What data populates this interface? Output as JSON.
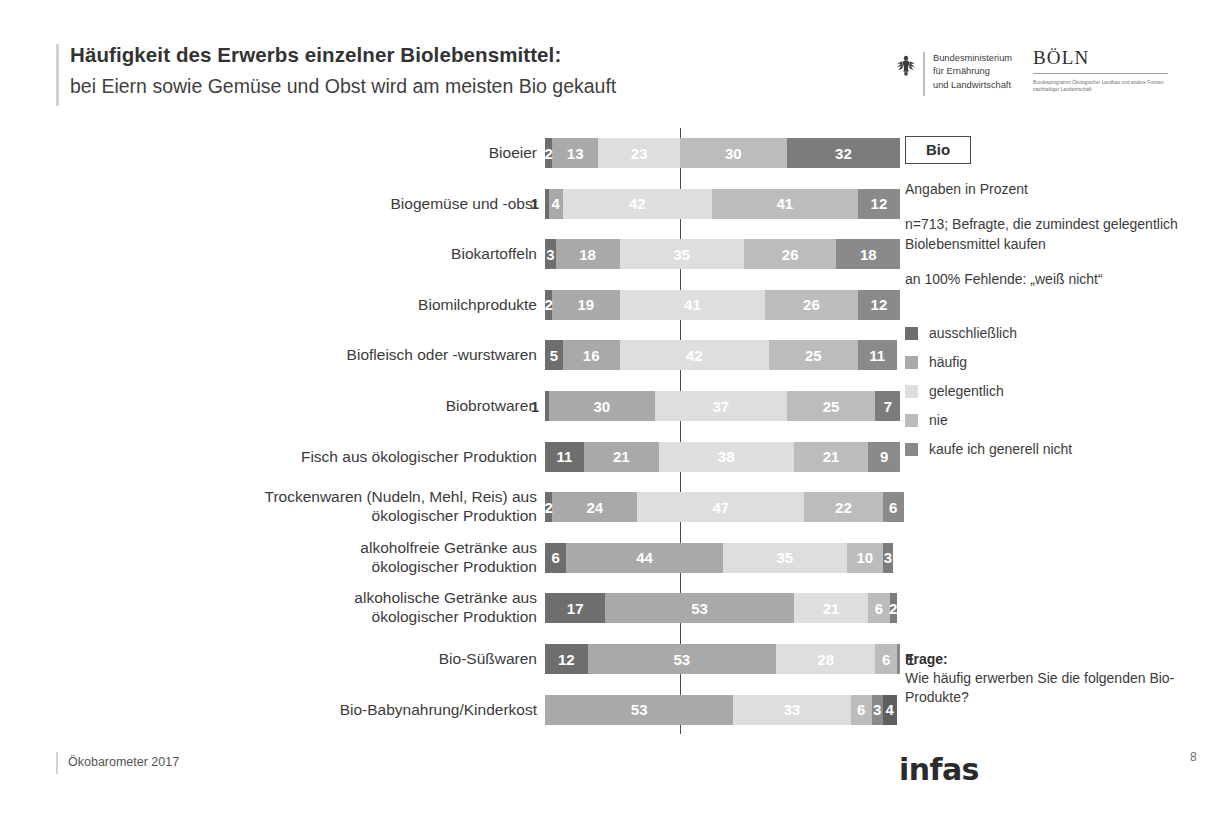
{
  "header": {
    "title_main": "Häufigkeit des Erwerbs einzelner Biolebensmittel:",
    "title_sub": "bei Eiern sowie Gemüse und Obst wird am meisten Bio gekauft",
    "bmel_line1": "Bundesministerium",
    "bmel_line2": "für Ernährung",
    "bmel_line3": "und Landwirtschaft",
    "boeln_word": "BÖLN",
    "boeln_tagline": "Bundesprogramm Ökologischer Landbau und andere Formen nachhaltiger Landwirtschaft"
  },
  "panel": {
    "bio_badge": "Bio",
    "units_note": "Angaben in Prozent",
    "base_note": "n=713; Befragte, die zumindest gelegentlich Biolebensmittel kaufen",
    "missing_note": "an 100% Fehlende: „weiß nicht“",
    "frage_label": "Frage:",
    "frage_text": "Wie häufig erwerben Sie die folgenden Bio-Produkte?"
  },
  "footer": {
    "source": "Ökobarometer 2017",
    "brand": "infas",
    "page_number": "8"
  },
  "chart_data": {
    "type": "bar",
    "orientation": "horizontal",
    "stacked": true,
    "title": "Häufigkeit des Erwerbs einzelner Biolebensmittel:",
    "subtitle": "bei Eiern sowie Gemüse und Obst wird am meisten Bio gekauft",
    "xlabel": "",
    "ylabel": "",
    "value_unit": "Prozent",
    "xlim": [
      0,
      100
    ],
    "grid": false,
    "legend_position": "right",
    "reference_line_at": 38,
    "series": [
      {
        "name": "ausschließlich",
        "color": "#6e6e6e",
        "values": [
          2,
          1,
          3,
          2,
          5,
          1,
          11,
          2,
          6,
          17,
          12,
          0
        ]
      },
      {
        "name": "häufig",
        "color": "#a9a9a9",
        "values": [
          13,
          4,
          18,
          19,
          16,
          30,
          21,
          24,
          44,
          53,
          53,
          53
        ]
      },
      {
        "name": "gelegentlich",
        "color": "#dedede",
        "values": [
          23,
          42,
          35,
          41,
          42,
          37,
          38,
          47,
          35,
          21,
          28,
          33
        ]
      },
      {
        "name": "nie",
        "color": "#bcbcbc",
        "values": [
          30,
          41,
          26,
          26,
          25,
          25,
          21,
          22,
          10,
          6,
          6,
          6
        ]
      },
      {
        "name": "kaufe ich generell nicht",
        "color": "#8a8a8a",
        "values": [
          32,
          12,
          18,
          12,
          11,
          7,
          9,
          6,
          3,
          2,
          1,
          3
        ]
      }
    ],
    "extra_segment": {
      "name": "rest",
      "color": "#5f5f5f",
      "values": [
        0,
        0,
        0,
        0,
        0,
        0,
        0,
        0,
        0,
        0,
        0,
        4
      ]
    },
    "categories": [
      "Bioeier",
      "Biogemüse und -obst",
      "Biokartoffeln",
      "Biomilchprodukte",
      "Biofleisch oder  -wurstwaren",
      "Biobrotwaren",
      "Fisch aus ökologischer Produktion",
      "Trockenwaren (Nudeln, Mehl, Reis) aus ökologischer Produktion",
      "alkoholfreie Getränke aus ökologischer Produktion",
      "alkoholische Getränke aus ökologischer Produktion",
      "Bio-Süßwaren",
      "Bio-Babynahrung/Kinderkost"
    ],
    "rows": [
      {
        "label": "Bioeier",
        "label_lines": [
          "Bioeier"
        ],
        "segments": [
          {
            "series": "ausschließlich",
            "value": 2,
            "color": "#6e6e6e",
            "label": "2",
            "placement": "inside"
          },
          {
            "series": "häufig",
            "value": 13,
            "color": "#a9a9a9",
            "label": "13",
            "placement": "inside"
          },
          {
            "series": "gelegentlich",
            "value": 23,
            "color": "#dedede",
            "label": "23",
            "placement": "inside"
          },
          {
            "series": "nie",
            "value": 30,
            "color": "#bcbcbc",
            "label": "30",
            "placement": "inside"
          },
          {
            "series": "kaufe ich generell nicht",
            "value": 32,
            "color": "#7c7c7c",
            "label": "32",
            "placement": "inside"
          }
        ]
      },
      {
        "label": "Biogemüse und -obst",
        "label_lines": [
          "Biogemüse und -obst"
        ],
        "segments": [
          {
            "series": "ausschließlich",
            "value": 1,
            "color": "#6e6e6e",
            "label": "1",
            "placement": "outside-left"
          },
          {
            "series": "häufig",
            "value": 4,
            "color": "#a9a9a9",
            "label": "4",
            "placement": "inside"
          },
          {
            "series": "gelegentlich",
            "value": 42,
            "color": "#dedede",
            "label": "42",
            "placement": "inside"
          },
          {
            "series": "nie",
            "value": 41,
            "color": "#bcbcbc",
            "label": "41",
            "placement": "inside"
          },
          {
            "series": "kaufe ich generell nicht",
            "value": 12,
            "color": "#8a8a8a",
            "label": "12",
            "placement": "inside"
          }
        ]
      },
      {
        "label": "Biokartoffeln",
        "label_lines": [
          "Biokartoffeln"
        ],
        "segments": [
          {
            "series": "ausschließlich",
            "value": 3,
            "color": "#6e6e6e",
            "label": "3",
            "placement": "inside"
          },
          {
            "series": "häufig",
            "value": 18,
            "color": "#a9a9a9",
            "label": "18",
            "placement": "inside"
          },
          {
            "series": "gelegentlich",
            "value": 35,
            "color": "#dedede",
            "label": "35",
            "placement": "inside"
          },
          {
            "series": "nie",
            "value": 26,
            "color": "#bcbcbc",
            "label": "26",
            "placement": "inside"
          },
          {
            "series": "kaufe ich generell nicht",
            "value": 18,
            "color": "#8a8a8a",
            "label": "18",
            "placement": "inside"
          }
        ]
      },
      {
        "label": "Biomilchprodukte",
        "label_lines": [
          "Biomilchprodukte"
        ],
        "segments": [
          {
            "series": "ausschließlich",
            "value": 2,
            "color": "#6e6e6e",
            "label": "2",
            "placement": "inside"
          },
          {
            "series": "häufig",
            "value": 19,
            "color": "#a9a9a9",
            "label": "19",
            "placement": "inside"
          },
          {
            "series": "gelegentlich",
            "value": 41,
            "color": "#dedede",
            "label": "41",
            "placement": "inside"
          },
          {
            "series": "nie",
            "value": 26,
            "color": "#bcbcbc",
            "label": "26",
            "placement": "inside"
          },
          {
            "series": "kaufe ich generell nicht",
            "value": 12,
            "color": "#8a8a8a",
            "label": "12",
            "placement": "inside"
          }
        ]
      },
      {
        "label": "Biofleisch oder  -wurstwaren",
        "label_lines": [
          "Biofleisch oder  -wurstwaren"
        ],
        "segments": [
          {
            "series": "ausschließlich",
            "value": 5,
            "color": "#6e6e6e",
            "label": "5",
            "placement": "inside"
          },
          {
            "series": "häufig",
            "value": 16,
            "color": "#a9a9a9",
            "label": "16",
            "placement": "inside"
          },
          {
            "series": "gelegentlich",
            "value": 42,
            "color": "#dedede",
            "label": "42",
            "placement": "inside"
          },
          {
            "series": "nie",
            "value": 25,
            "color": "#bcbcbc",
            "label": "25",
            "placement": "inside"
          },
          {
            "series": "kaufe ich generell nicht",
            "value": 11,
            "color": "#8a8a8a",
            "label": "11",
            "placement": "inside"
          }
        ]
      },
      {
        "label": "Biobrotwaren",
        "label_lines": [
          "Biobrotwaren"
        ],
        "segments": [
          {
            "series": "ausschließlich",
            "value": 1,
            "color": "#6e6e6e",
            "label": "1",
            "placement": "outside-left"
          },
          {
            "series": "häufig",
            "value": 30,
            "color": "#a9a9a9",
            "label": "30",
            "placement": "inside"
          },
          {
            "series": "gelegentlich",
            "value": 37,
            "color": "#dedede",
            "label": "37",
            "placement": "inside"
          },
          {
            "series": "nie",
            "value": 25,
            "color": "#bcbcbc",
            "label": "25",
            "placement": "inside"
          },
          {
            "series": "kaufe ich generell nicht",
            "value": 7,
            "color": "#7c7c7c",
            "label": "7",
            "placement": "inside"
          }
        ]
      },
      {
        "label": "Fisch aus ökologischer Produktion",
        "label_lines": [
          "Fisch aus ökologischer Produktion"
        ],
        "segments": [
          {
            "series": "ausschließlich",
            "value": 11,
            "color": "#6e6e6e",
            "label": "11",
            "placement": "inside"
          },
          {
            "series": "häufig",
            "value": 21,
            "color": "#a9a9a9",
            "label": "21",
            "placement": "inside"
          },
          {
            "series": "gelegentlich",
            "value": 38,
            "color": "#dedede",
            "label": "38",
            "placement": "inside"
          },
          {
            "series": "nie",
            "value": 21,
            "color": "#bcbcbc",
            "label": "21",
            "placement": "inside"
          },
          {
            "series": "kaufe ich generell nicht",
            "value": 9,
            "color": "#8a8a8a",
            "label": "9",
            "placement": "inside"
          }
        ]
      },
      {
        "label": "Trockenwaren (Nudeln, Mehl, Reis) aus ökologischer Produktion",
        "label_lines": [
          "Trockenwaren (Nudeln, Mehl, Reis) aus",
          "ökologischer Produktion"
        ],
        "segments": [
          {
            "series": "ausschließlich",
            "value": 2,
            "color": "#6e6e6e",
            "label": "2",
            "placement": "inside"
          },
          {
            "series": "häufig",
            "value": 24,
            "color": "#a9a9a9",
            "label": "24",
            "placement": "inside"
          },
          {
            "series": "gelegentlich",
            "value": 47,
            "color": "#dedede",
            "label": "47",
            "placement": "inside"
          },
          {
            "series": "nie",
            "value": 22,
            "color": "#bcbcbc",
            "label": "22",
            "placement": "inside"
          },
          {
            "series": "kaufe ich generell nicht",
            "value": 6,
            "color": "#8a8a8a",
            "label": "6",
            "placement": "inside"
          }
        ]
      },
      {
        "label": "alkoholfreie Getränke aus ökologischer Produktion",
        "label_lines": [
          "alkoholfreie Getränke aus",
          "ökologischer Produktion"
        ],
        "segments": [
          {
            "series": "ausschließlich",
            "value": 6,
            "color": "#6e6e6e",
            "label": "6",
            "placement": "inside"
          },
          {
            "series": "häufig",
            "value": 44,
            "color": "#a9a9a9",
            "label": "44",
            "placement": "inside"
          },
          {
            "series": "gelegentlich",
            "value": 35,
            "color": "#dedede",
            "label": "35",
            "placement": "inside"
          },
          {
            "series": "nie",
            "value": 10,
            "color": "#bcbcbc",
            "label": "10",
            "placement": "inside"
          },
          {
            "series": "kaufe ich generell nicht",
            "value": 3,
            "color": "#7c7c7c",
            "label": "3",
            "placement": "inside"
          }
        ]
      },
      {
        "label": "alkoholische Getränke aus ökologischer Produktion",
        "label_lines": [
          "alkoholische Getränke aus",
          "ökologischer Produktion"
        ],
        "segments": [
          {
            "series": "ausschließlich",
            "value": 17,
            "color": "#6e6e6e",
            "label": "17",
            "placement": "inside"
          },
          {
            "series": "häufig",
            "value": 53,
            "color": "#a9a9a9",
            "label": "53",
            "placement": "inside"
          },
          {
            "series": "gelegentlich",
            "value": 21,
            "color": "#dedede",
            "label": "21",
            "placement": "inside"
          },
          {
            "series": "nie",
            "value": 6,
            "color": "#bcbcbc",
            "label": "6",
            "placement": "inside"
          },
          {
            "series": "kaufe ich generell nicht",
            "value": 2,
            "color": "#7c7c7c",
            "label": "2",
            "placement": "inside"
          }
        ]
      },
      {
        "label": "Bio-Süßwaren",
        "label_lines": [
          "Bio-Süßwaren"
        ],
        "segments": [
          {
            "series": "ausschließlich",
            "value": 12,
            "color": "#6e6e6e",
            "label": "12",
            "placement": "inside"
          },
          {
            "series": "häufig",
            "value": 53,
            "color": "#a9a9a9",
            "label": "53",
            "placement": "inside"
          },
          {
            "series": "gelegentlich",
            "value": 28,
            "color": "#dedede",
            "label": "28",
            "placement": "inside"
          },
          {
            "series": "nie",
            "value": 6,
            "color": "#bcbcbc",
            "label": "6",
            "placement": "inside"
          },
          {
            "series": "kaufe ich generell nicht",
            "value": 1,
            "color": "#8a8a8a",
            "label": "1",
            "placement": "outside-right"
          }
        ]
      },
      {
        "label": "Bio-Babynahrung/Kinderkost",
        "label_lines": [
          "Bio-Babynahrung/Kinderkost"
        ],
        "segments": [
          {
            "series": "häufig",
            "value": 53,
            "color": "#a9a9a9",
            "label": "53",
            "placement": "inside"
          },
          {
            "series": "gelegentlich",
            "value": 33,
            "color": "#dedede",
            "label": "33",
            "placement": "inside"
          },
          {
            "series": "nie",
            "value": 6,
            "color": "#bcbcbc",
            "label": "6",
            "placement": "inside"
          },
          {
            "series": "kaufe ich generell nicht",
            "value": 3,
            "color": "#8a8a8a",
            "label": "3",
            "placement": "inside"
          },
          {
            "series": "rest",
            "value": 4,
            "color": "#5f5f5f",
            "label": "4",
            "placement": "inside"
          }
        ]
      }
    ],
    "legend": [
      {
        "label": "ausschließlich",
        "color": "#6e6e6e"
      },
      {
        "label": "häufig",
        "color": "#a9a9a9"
      },
      {
        "label": "gelegentlich",
        "color": "#dedede"
      },
      {
        "label": "nie",
        "color": "#bcbcbc"
      },
      {
        "label": "kaufe ich generell nicht",
        "color": "#8a8a8a"
      }
    ]
  }
}
